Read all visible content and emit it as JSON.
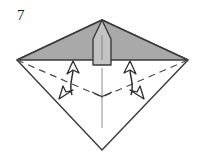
{
  "figure": {
    "step_number": "7",
    "type": "origami-fold-diagram",
    "caption": ""
  },
  "colors": {
    "background": "#ffffff",
    "outline": "#3a3a3a",
    "shaded_fill": "#a9a9a9",
    "flap_fill": "#c3c3c3",
    "crease_line": "#b4b4b4",
    "dashed_line": "#4a4a4a",
    "arrow_stroke": "#2e2e2e",
    "arrow_fill": "#ffffff",
    "text": "#1a1a1a"
  },
  "shapes": {
    "kite_outline": {
      "name": "paper-outline-kite",
      "points": "102,20 188,60 102,150 17,60"
    },
    "shaded_triangle": {
      "name": "shaded-upper-triangle",
      "points": "102,20 188,60 17,60"
    },
    "center_flap": {
      "name": "center-pointed-flap",
      "points": "102,20 111,38 111,65 93,65 93,38"
    },
    "flap_center_crease": {
      "name": "flap-center-crease",
      "x1": 102,
      "y1": 34,
      "x2": 102,
      "y2": 60
    },
    "vertical_crease": {
      "name": "vertical-center-crease",
      "x1": 102,
      "y1": 68,
      "x2": 102,
      "y2": 128
    },
    "dashed_left": {
      "name": "dashed-crease-left",
      "x1": 17,
      "y1": 60,
      "x2": 102,
      "y2": 97
    },
    "dashed_right": {
      "name": "dashed-crease-right",
      "x1": 188,
      "y1": 60,
      "x2": 102,
      "y2": 97
    },
    "center_tick_left": {
      "name": "center-tick-left",
      "x1": 92,
      "y1": 93,
      "x2": 102,
      "y2": 97
    },
    "center_tick_right": {
      "name": "center-tick-right",
      "x1": 112,
      "y1": 93,
      "x2": 102,
      "y2": 97
    }
  },
  "arrows": [
    {
      "name": "fold-arrow-left-up",
      "path": "M 70,96 C 66,84 74,74 73,65",
      "head": "67,62 79,66 72,72",
      "direction": "up"
    },
    {
      "name": "fold-arrow-left-down",
      "path": "M 73,66 C 74,78 66,86 64,94",
      "head": "58,92 71,90 69,101",
      "direction": "down-left"
    },
    {
      "name": "fold-arrow-right-up",
      "path": "M 133,96 C 137,84 129,74 130,65",
      "head": "124,66 136,62 131,72",
      "direction": "up"
    },
    {
      "name": "fold-arrow-right-down",
      "path": "M 130,66 C 129,78 137,86 139,94",
      "head": "134,101 132,90 145,92",
      "direction": "down-right"
    }
  ]
}
